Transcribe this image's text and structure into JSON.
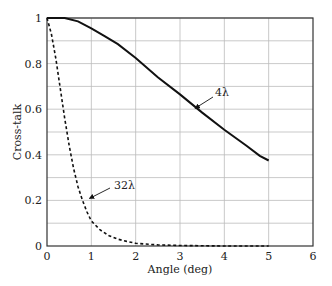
{
  "chart_data": {
    "type": "line",
    "title": "",
    "xlabel": "Angle (deg)",
    "ylabel": "Cross-talk",
    "xlim": [
      0,
      6
    ],
    "ylim": [
      0,
      1
    ],
    "xticks": [
      "0",
      "1",
      "2",
      "3",
      "4",
      "5",
      "6"
    ],
    "yticks": [
      "0",
      "0.2",
      "0.4",
      "0.6",
      "0.8",
      "1"
    ],
    "grid": true,
    "legend": "none (inline annotations with arrows)",
    "series": [
      {
        "name": "4λ",
        "style": "solid",
        "x": [
          0,
          0.4,
          0.7,
          1.0,
          1.3,
          1.6,
          2.0,
          2.5,
          3.0,
          3.5,
          4.0,
          4.5,
          4.8,
          5.0
        ],
        "y": [
          1.0,
          1.0,
          0.985,
          0.955,
          0.92,
          0.885,
          0.825,
          0.74,
          0.665,
          0.585,
          0.51,
          0.44,
          0.395,
          0.375
        ]
      },
      {
        "name": "32λ",
        "style": "dashed",
        "x": [
          0,
          0.1,
          0.2,
          0.3,
          0.4,
          0.5,
          0.6,
          0.7,
          0.8,
          0.9,
          1.0,
          1.2,
          1.4,
          1.6,
          1.8,
          2.0,
          2.5,
          3.0,
          4.0,
          5.0
        ],
        "y": [
          1.0,
          0.93,
          0.82,
          0.69,
          0.56,
          0.44,
          0.34,
          0.26,
          0.2,
          0.15,
          0.11,
          0.07,
          0.045,
          0.03,
          0.02,
          0.012,
          0.005,
          0.002,
          0.0,
          0.0
        ]
      }
    ],
    "annotations": [
      {
        "text": "4λ",
        "arrow_to": [
          3.3,
          0.6
        ]
      },
      {
        "text": "32λ",
        "arrow_to": [
          0.87,
          0.2
        ]
      }
    ]
  }
}
